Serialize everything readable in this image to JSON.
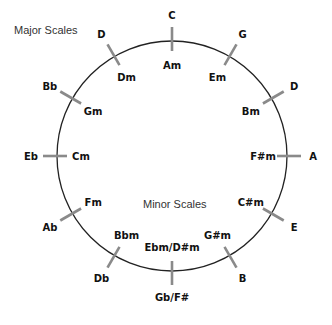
{
  "diagram": {
    "captions": {
      "major": "Major Scales",
      "minor": "Minor Scales"
    },
    "colors": {
      "circle": "#222222",
      "tick": "#8a8a8a",
      "text": "#111111",
      "caption": "#333333"
    },
    "circle": {
      "cx": 172,
      "cy": 156,
      "r": 115
    },
    "keys": [
      {
        "position": 0,
        "major": "C",
        "minor": "Am"
      },
      {
        "position": 1,
        "major": "G",
        "minor": "Em"
      },
      {
        "position": 2,
        "major": "D",
        "minor": "Bm"
      },
      {
        "position": 3,
        "major": "A",
        "minor": "F#m"
      },
      {
        "position": 4,
        "major": "E",
        "minor": "C#m"
      },
      {
        "position": 5,
        "major": "B",
        "minor": "G#m"
      },
      {
        "position": 6,
        "major": "Gb/F#",
        "minor": "Ebm/D#m"
      },
      {
        "position": 7,
        "major": "Db",
        "minor": "Bbm"
      },
      {
        "position": 8,
        "major": "Ab",
        "minor": "Fm"
      },
      {
        "position": 9,
        "major": "Eb",
        "minor": "Cm"
      },
      {
        "position": 10,
        "major": "Bb",
        "minor": "Gm"
      },
      {
        "position": 11,
        "major": "D",
        "minor": "Dm"
      }
    ]
  }
}
